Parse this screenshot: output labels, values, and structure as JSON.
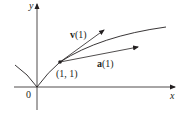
{
  "diagram": {
    "axes": {
      "x_label": "x",
      "y_label": "y",
      "origin_label": "0"
    },
    "point": {
      "label": "(1, 1)"
    },
    "vectors": [
      {
        "name": "v",
        "arg": "(1)"
      },
      {
        "name": "a",
        "arg": "(1)"
      }
    ],
    "colors": {
      "stroke": "#231f20",
      "background": "#ffffff"
    }
  }
}
